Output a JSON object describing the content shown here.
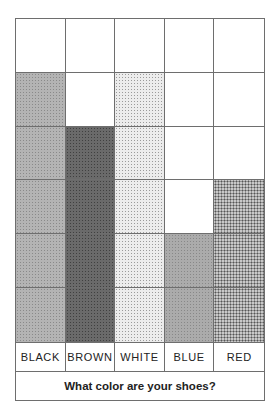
{
  "chart_data": {
    "type": "bar",
    "subtype": "pictograph-grid",
    "title": "What color are your shoes?",
    "categories": [
      "BLACK",
      "BROWN",
      "WHITE",
      "BLUE",
      "RED"
    ],
    "values": [
      5,
      4,
      5,
      2,
      3
    ],
    "ylim": [
      0,
      6
    ],
    "grid": true,
    "xlabel": "",
    "ylabel": ""
  },
  "labels": [
    "BLACK",
    "BROWN",
    "WHITE",
    "BLUE",
    "RED"
  ],
  "title": "What color are your shoes?"
}
